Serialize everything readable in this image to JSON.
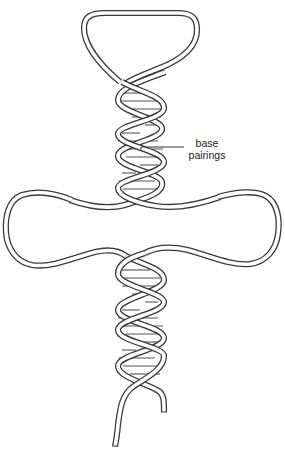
{
  "figure": {
    "type": "diagram",
    "stroke_color": "#3a3a3a",
    "background_color": "#ffffff"
  },
  "annotations": [
    {
      "id": "base-pairings",
      "line1": "base",
      "line2": "pairings",
      "points_to": "upper helix rungs"
    }
  ],
  "components": {
    "top_loop": "hairpin loop",
    "upper_helix": "double-stranded helix with base pairs",
    "middle_loops": [
      "left loop",
      "right loop"
    ],
    "lower_helix": "double-stranded helix with base pairs",
    "tails": [
      "left strand end",
      "right strand end"
    ]
  }
}
